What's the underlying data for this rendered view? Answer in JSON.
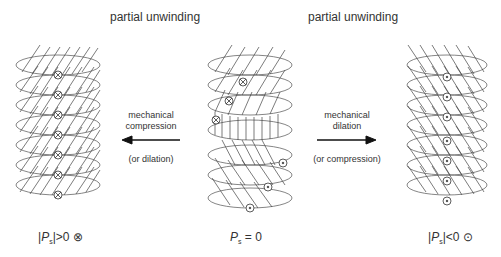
{
  "titles": {
    "left": "partial unwinding",
    "right": "partial unwinding"
  },
  "arrows": {
    "left": {
      "direction": "left",
      "label_line1": "mechanical",
      "label_line2": "compression",
      "sub_label": "(or dilation)"
    },
    "right": {
      "direction": "right",
      "label_line1": "mechanical",
      "label_line2": "dilation",
      "sub_label": "(or compression)"
    }
  },
  "helices": [
    {
      "name": "left-helix",
      "molecule_tilt": "right-leaning",
      "dipole_symbol": "cross-circle",
      "layers": 7
    },
    {
      "name": "center-helix",
      "molecule_tilt": "mixed",
      "dipole_symbol": "mixed",
      "layers": 7
    },
    {
      "name": "right-helix",
      "molecule_tilt": "left-leaning",
      "dipole_symbol": "dot-circle",
      "layers": 7
    }
  ],
  "captions": {
    "left": {
      "prefix": "|",
      "P": "P",
      "sub": "s",
      "suffix": "|>0",
      "symbol": "⊗"
    },
    "center": {
      "P": "P",
      "sub": "s",
      "suffix": " = 0"
    },
    "right": {
      "prefix": "|",
      "P": "P",
      "sub": "s",
      "suffix": "|<0",
      "symbol": "⊙"
    }
  },
  "colors": {
    "line": "#555555",
    "text": "#333333",
    "background": "#ffffff"
  }
}
